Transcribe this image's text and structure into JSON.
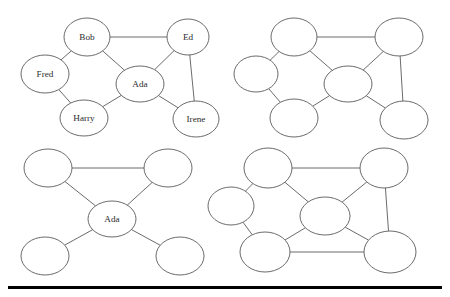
{
  "figure": {
    "type": "graph-diagram-grid",
    "background_color": "#ffffff",
    "node_stroke_color": "#5a5a5a",
    "edge_color": "#5a5a5a",
    "label_color": "#2b2b2b",
    "rule_color": "#000000",
    "node_rx": 22,
    "node_ry": 18,
    "panel_count": 4
  },
  "graphs": [
    {
      "id": "top-left",
      "name": "labeled-social-graph",
      "labeled": true,
      "nodes": [
        {
          "id": "bob",
          "label": "Bob",
          "x": 87,
          "y": 37,
          "rx": 23,
          "ry": 19
        },
        {
          "id": "ed",
          "label": "Ed",
          "x": 188,
          "y": 37,
          "rx": 21,
          "ry": 18
        },
        {
          "id": "fred",
          "label": "Fred",
          "x": 45,
          "y": 74,
          "rx": 24,
          "ry": 19
        },
        {
          "id": "ada",
          "label": "Ada",
          "x": 140,
          "y": 84,
          "rx": 24,
          "ry": 18
        },
        {
          "id": "harry",
          "label": "Harry",
          "x": 84,
          "y": 118,
          "rx": 24,
          "ry": 18
        },
        {
          "id": "irene",
          "label": "Irene",
          "x": 196,
          "y": 119,
          "rx": 23,
          "ry": 18
        }
      ],
      "edges": [
        {
          "from": "bob",
          "to": "ed"
        },
        {
          "from": "bob",
          "to": "fred"
        },
        {
          "from": "bob",
          "to": "ada"
        },
        {
          "from": "fred",
          "to": "harry"
        },
        {
          "from": "harry",
          "to": "ada"
        },
        {
          "from": "ada",
          "to": "ed"
        },
        {
          "from": "ada",
          "to": "irene"
        },
        {
          "from": "ed",
          "to": "irene"
        }
      ]
    },
    {
      "id": "top-right",
      "name": "unlabeled-social-graph",
      "labeled": false,
      "nodes": [
        {
          "id": "n1",
          "label": "",
          "x": 294,
          "y": 37,
          "rx": 23,
          "ry": 19
        },
        {
          "id": "n2",
          "label": "",
          "x": 399,
          "y": 37,
          "rx": 24,
          "ry": 19
        },
        {
          "id": "n3",
          "label": "",
          "x": 256,
          "y": 74,
          "rx": 22,
          "ry": 18
        },
        {
          "id": "n4",
          "label": "",
          "x": 348,
          "y": 84,
          "rx": 24,
          "ry": 18
        },
        {
          "id": "n5",
          "label": "",
          "x": 294,
          "y": 118,
          "rx": 24,
          "ry": 19
        },
        {
          "id": "n6",
          "label": "",
          "x": 404,
          "y": 120,
          "rx": 24,
          "ry": 19
        }
      ],
      "edges": [
        {
          "from": "n1",
          "to": "n2"
        },
        {
          "from": "n1",
          "to": "n3"
        },
        {
          "from": "n1",
          "to": "n4"
        },
        {
          "from": "n3",
          "to": "n5"
        },
        {
          "from": "n5",
          "to": "n4"
        },
        {
          "from": "n4",
          "to": "n2"
        },
        {
          "from": "n4",
          "to": "n6"
        },
        {
          "from": "n2",
          "to": "n6"
        }
      ]
    },
    {
      "id": "bottom-left",
      "name": "ada-star-graph",
      "labeled": true,
      "nodes": [
        {
          "id": "t1",
          "label": "",
          "x": 48,
          "y": 168,
          "rx": 24,
          "ry": 19
        },
        {
          "id": "t2",
          "label": "",
          "x": 168,
          "y": 168,
          "rx": 24,
          "ry": 19
        },
        {
          "id": "ada",
          "label": "Ada",
          "x": 112,
          "y": 219,
          "rx": 24,
          "ry": 18
        },
        {
          "id": "b1",
          "label": "",
          "x": 45,
          "y": 256,
          "rx": 24,
          "ry": 19
        },
        {
          "id": "b2",
          "label": "",
          "x": 180,
          "y": 256,
          "rx": 24,
          "ry": 19
        }
      ],
      "edges": [
        {
          "from": "t1",
          "to": "t2"
        },
        {
          "from": "t1",
          "to": "ada"
        },
        {
          "from": "t2",
          "to": "ada"
        },
        {
          "from": "ada",
          "to": "b1"
        },
        {
          "from": "ada",
          "to": "b2"
        }
      ]
    },
    {
      "id": "bottom-right",
      "name": "dense-social-graph",
      "labeled": false,
      "nodes": [
        {
          "id": "m1",
          "label": "",
          "x": 268,
          "y": 168,
          "rx": 24,
          "ry": 20
        },
        {
          "id": "m2",
          "label": "",
          "x": 384,
          "y": 168,
          "rx": 24,
          "ry": 20
        },
        {
          "id": "m3",
          "label": "",
          "x": 231,
          "y": 206,
          "rx": 23,
          "ry": 19
        },
        {
          "id": "m4",
          "label": "",
          "x": 325,
          "y": 216,
          "rx": 25,
          "ry": 19
        },
        {
          "id": "m5",
          "label": "",
          "x": 265,
          "y": 252,
          "rx": 25,
          "ry": 20
        },
        {
          "id": "m6",
          "label": "",
          "x": 390,
          "y": 252,
          "rx": 26,
          "ry": 21
        }
      ],
      "edges": [
        {
          "from": "m1",
          "to": "m2"
        },
        {
          "from": "m1",
          "to": "m3"
        },
        {
          "from": "m1",
          "to": "m4"
        },
        {
          "from": "m3",
          "to": "m5"
        },
        {
          "from": "m5",
          "to": "m4"
        },
        {
          "from": "m4",
          "to": "m2"
        },
        {
          "from": "m4",
          "to": "m6"
        },
        {
          "from": "m2",
          "to": "m6"
        },
        {
          "from": "m5",
          "to": "m6"
        }
      ]
    }
  ],
  "rule": {
    "label": "horizontal-rule",
    "x": 8,
    "y": 286,
    "width": 434,
    "height": 3
  }
}
